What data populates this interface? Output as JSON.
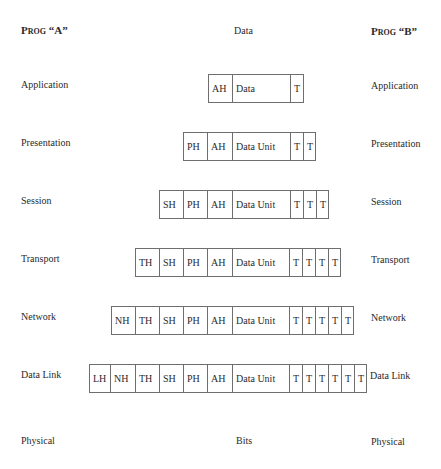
{
  "header": {
    "left": "Prog “A”",
    "center": "Data",
    "right": "Prog “B”"
  },
  "layers": [
    {
      "name": "Application",
      "top": 80,
      "cells": [
        {
          "label": "AH",
          "x": 208,
          "w": 24
        },
        {
          "label": "Data",
          "x": 232,
          "w": 58
        },
        {
          "label": "T",
          "x": 290,
          "w": 14
        }
      ]
    },
    {
      "name": "Presentation",
      "top": 138,
      "cells": [
        {
          "label": "PH",
          "x": 183,
          "w": 24
        },
        {
          "label": "AH",
          "x": 207,
          "w": 25
        },
        {
          "label": "Data Unit",
          "x": 232,
          "w": 58
        },
        {
          "label": "T",
          "x": 290,
          "w": 13
        },
        {
          "label": "T",
          "x": 303,
          "w": 13
        }
      ]
    },
    {
      "name": "Session",
      "top": 196,
      "cells": [
        {
          "label": "SH",
          "x": 159,
          "w": 24
        },
        {
          "label": "PH",
          "x": 183,
          "w": 24
        },
        {
          "label": "AH",
          "x": 207,
          "w": 25
        },
        {
          "label": "Data Unit",
          "x": 232,
          "w": 58
        },
        {
          "label": "T",
          "x": 290,
          "w": 13
        },
        {
          "label": "T",
          "x": 303,
          "w": 13
        },
        {
          "label": "T",
          "x": 316,
          "w": 13
        }
      ]
    },
    {
      "name": "Transport",
      "top": 254,
      "cells": [
        {
          "label": "TH",
          "x": 135,
          "w": 24
        },
        {
          "label": "SH",
          "x": 159,
          "w": 24
        },
        {
          "label": "PH",
          "x": 183,
          "w": 24
        },
        {
          "label": "AH",
          "x": 207,
          "w": 25
        },
        {
          "label": "Data Unit",
          "x": 232,
          "w": 57
        },
        {
          "label": "T",
          "x": 289,
          "w": 13
        },
        {
          "label": "T",
          "x": 302,
          "w": 13
        },
        {
          "label": "T",
          "x": 315,
          "w": 13
        },
        {
          "label": "T",
          "x": 328,
          "w": 13
        }
      ]
    },
    {
      "name": "Network",
      "top": 312,
      "cells": [
        {
          "label": "NH",
          "x": 111,
          "w": 24
        },
        {
          "label": "TH",
          "x": 135,
          "w": 24
        },
        {
          "label": "SH",
          "x": 159,
          "w": 24
        },
        {
          "label": "PH",
          "x": 183,
          "w": 24
        },
        {
          "label": "AH",
          "x": 207,
          "w": 25
        },
        {
          "label": "Data Unit",
          "x": 232,
          "w": 57
        },
        {
          "label": "T",
          "x": 289,
          "w": 13
        },
        {
          "label": "T",
          "x": 302,
          "w": 13
        },
        {
          "label": "T",
          "x": 315,
          "w": 13
        },
        {
          "label": "T",
          "x": 328,
          "w": 13
        },
        {
          "label": "T",
          "x": 341,
          "w": 13
        }
      ]
    },
    {
      "name": "Data Link",
      "top": 370,
      "cells": [
        {
          "label": "LH",
          "x": 89,
          "w": 21
        },
        {
          "label": "NH",
          "x": 110,
          "w": 25
        },
        {
          "label": "TH",
          "x": 135,
          "w": 24
        },
        {
          "label": "SH",
          "x": 159,
          "w": 24
        },
        {
          "label": "PH",
          "x": 183,
          "w": 24
        },
        {
          "label": "AH",
          "x": 207,
          "w": 25
        },
        {
          "label": "Data Unit",
          "x": 232,
          "w": 57
        },
        {
          "label": "T",
          "x": 289,
          "w": 13
        },
        {
          "label": "T",
          "x": 302,
          "w": 13
        },
        {
          "label": "T",
          "x": 315,
          "w": 13
        },
        {
          "label": "T",
          "x": 328,
          "w": 13
        },
        {
          "label": "T",
          "x": 341,
          "w": 13
        },
        {
          "label": "T",
          "x": 354,
          "w": 13
        }
      ]
    }
  ],
  "physical": {
    "name": "Physical",
    "center": "Bits"
  }
}
